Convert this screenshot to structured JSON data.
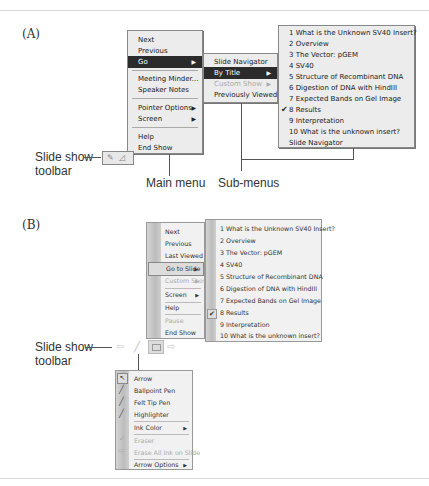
{
  "panel_a": {
    "label": "(A)",
    "main_menu": {
      "items": [
        {
          "label": "Next",
          "state": "normal"
        },
        {
          "label": "Previous",
          "state": "normal"
        },
        {
          "label": "Go",
          "state": "selected",
          "submenu": true
        },
        {
          "label": "Meeting Minder...",
          "state": "normal"
        },
        {
          "label": "Speaker Notes",
          "state": "normal"
        },
        {
          "label": "Pointer Options",
          "state": "normal",
          "submenu": true
        },
        {
          "label": "Screen",
          "state": "normal",
          "submenu": true
        },
        {
          "label": "Help",
          "state": "normal"
        },
        {
          "label": "End Show",
          "state": "normal"
        }
      ]
    },
    "go_submenu": {
      "items": [
        {
          "label": "Slide Navigator",
          "state": "normal"
        },
        {
          "label": "By Title",
          "state": "selected",
          "submenu": true
        },
        {
          "label": "Custom Show",
          "state": "disabled",
          "submenu": true
        },
        {
          "label": "Previously Viewed",
          "state": "normal"
        }
      ]
    },
    "by_title_submenu": {
      "items": [
        {
          "label": "1 What is the Unknown SV40 Insert?"
        },
        {
          "label": "2 Overview"
        },
        {
          "label": "3 The Vector: pGEM"
        },
        {
          "label": "4 SV40"
        },
        {
          "label": "5 Structure of Recombinant DNA"
        },
        {
          "label": "6 Digestion of DNA with HindIII"
        },
        {
          "label": "7 Expected Bands on Gel Image"
        },
        {
          "label": "8 Results",
          "checked": true
        },
        {
          "label": "9 Interpretation"
        },
        {
          "label": "10 What is the unknown insert?"
        },
        {
          "label": "Slide Navigator"
        }
      ]
    },
    "callouts": {
      "toolbar": "Slide show\ntoolbar",
      "toolbar_line1": "Slide show",
      "toolbar_line2": "toolbar",
      "main_menu": "Main menu",
      "sub_menus": "Sub-menus"
    }
  },
  "panel_b": {
    "label": "(B)",
    "main_menu": {
      "items": [
        {
          "label": "Next",
          "state": "normal"
        },
        {
          "label": "Previous",
          "state": "normal"
        },
        {
          "label": "Last Viewed",
          "state": "normal"
        },
        {
          "label": "Go to Slide",
          "state": "selected",
          "submenu": true
        },
        {
          "label": "Custom Show",
          "state": "disabled",
          "submenu": true
        },
        {
          "label": "Screen",
          "state": "normal",
          "submenu": true
        },
        {
          "label": "Help",
          "state": "normal"
        },
        {
          "label": "Pause",
          "state": "disabled"
        },
        {
          "label": "End Show",
          "state": "normal"
        }
      ]
    },
    "slide_submenu": {
      "items": [
        {
          "label": "1 What is the Unknown SV40 Insert?"
        },
        {
          "label": "2 Overview"
        },
        {
          "label": "3 The Vector: pGEM"
        },
        {
          "label": "4 SV40"
        },
        {
          "label": "5 Structure of Recombinant DNA"
        },
        {
          "label": "6 Digestion of DNA with HindIII"
        },
        {
          "label": "7 Expected Bands on Gel Image"
        },
        {
          "label": "8 Results",
          "checked": true
        },
        {
          "label": "9 Interpretation"
        },
        {
          "label": "10 What is the unknown insert?"
        }
      ]
    },
    "pointer_menu": {
      "items": [
        {
          "label": "Arrow",
          "state": "selected"
        },
        {
          "label": "Ballpoint Pen",
          "state": "normal"
        },
        {
          "label": "Felt Tip Pen",
          "state": "normal"
        },
        {
          "label": "Highlighter",
          "state": "normal"
        },
        {
          "label": "Ink Color",
          "state": "normal",
          "submenu": true
        },
        {
          "label": "Eraser",
          "state": "disabled"
        },
        {
          "label": "Erase All Ink on Slide",
          "state": "disabled"
        },
        {
          "label": "Arrow Options",
          "state": "normal",
          "submenu": true
        }
      ]
    },
    "toolbar_icons": [
      "previous-arrow-icon",
      "pen-icon",
      "menu-icon",
      "next-arrow-icon"
    ],
    "callouts": {
      "toolbar_line1": "Slide show",
      "toolbar_line2": "toolbar"
    }
  },
  "glyphs": {
    "submenu_arrow": "▶",
    "check": "✔"
  }
}
